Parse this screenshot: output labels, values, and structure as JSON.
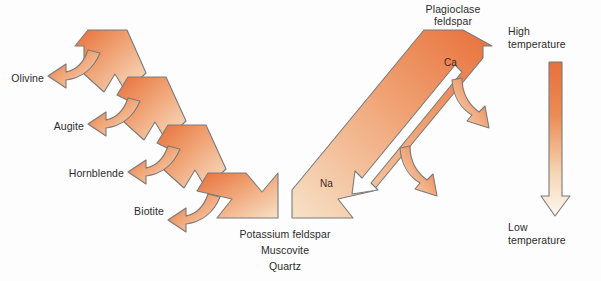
{
  "diagram": {
    "background_color": "#fdfdfd",
    "outline_color": "#7a7a7a",
    "text_color": "#2b2b2b"
  },
  "discontinuous_series": {
    "name": "discontinuous-branch",
    "minerals": [
      {
        "label": "Olivine"
      },
      {
        "label": "Augite"
      },
      {
        "label": "Hornblende"
      },
      {
        "label": "Biotite"
      }
    ]
  },
  "continuous_series": {
    "name": "continuous-branch",
    "header_line1": "Plagioclase",
    "header_line2": "feldspar",
    "ion_top": "Ca",
    "ion_bottom": "Na"
  },
  "convergence": {
    "line1": "Potassium feldspar",
    "line2": "Muscovite",
    "line3": "Quartz"
  },
  "temperature_scale": {
    "high_line1": "High",
    "high_line2": "temperature",
    "low_line1": "Low",
    "low_line2": "temperature",
    "hot_color": "#e8703a",
    "cool_color": "#fbf1e4"
  }
}
